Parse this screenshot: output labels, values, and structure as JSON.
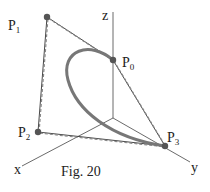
{
  "figure": {
    "caption": "Fig. 20",
    "axes": {
      "x": "x",
      "y": "y",
      "z": "z"
    },
    "points": [
      {
        "name": "P0",
        "base": "P",
        "sub": "0"
      },
      {
        "name": "P1",
        "base": "P",
        "sub": "1"
      },
      {
        "name": "P2",
        "base": "P",
        "sub": "2"
      },
      {
        "name": "P3",
        "base": "P",
        "sub": "3"
      }
    ],
    "colors": {
      "curve": "#777777",
      "point": "#555555",
      "line": "#333333"
    }
  }
}
